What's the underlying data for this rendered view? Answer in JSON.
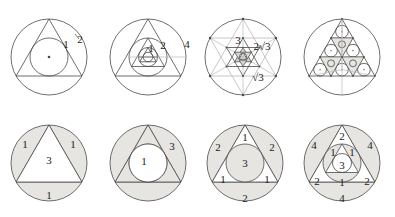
{
  "page": {
    "background_color": "#ffffff",
    "stroke_color": "#4a4a4a",
    "light_stroke_color": "#b9b9b9",
    "shade_color": "#e7e5e1",
    "text_color": "#1b1b1b",
    "rows": 2,
    "columns": 4
  },
  "figures": [
    {
      "id": "fig-top-1",
      "row": 1,
      "column": 1,
      "description": "Equilateral triangle with inscribed circle and circumscribed circle, center dot marked",
      "shaded": false,
      "labels": [
        {
          "text": "1",
          "role": "inradius",
          "x": 66,
          "y": 45
        },
        {
          "text": "2",
          "role": "circumradius",
          "x": 80,
          "y": 40
        }
      ]
    },
    {
      "id": "fig-top-2",
      "row": 1,
      "column": 2,
      "description": "Nested alternating triangles and circles showing doubling radii 1, 2, 4",
      "shaded": false,
      "labels": [
        {
          "text": "1",
          "role": "inner-radius",
          "x": 151,
          "y": 49
        },
        {
          "text": "2",
          "role": "middle-radius",
          "x": 163,
          "y": 46
        },
        {
          "text": "4",
          "role": "outer-radius",
          "x": 187,
          "y": 45
        }
      ]
    },
    {
      "id": "fig-top-3",
      "row": 1,
      "column": 3,
      "description": "Star-of-David lattice of triangles inside a circle with vertex dots, side lengths labelled",
      "shaded": false,
      "labels": [
        {
          "text": "3",
          "role": "side-upper",
          "x": 238,
          "y": 41
        },
        {
          "text": "2√3",
          "role": "side-diagonal",
          "x": 262,
          "y": 47
        },
        {
          "text": "√3",
          "role": "side-lower",
          "x": 258,
          "y": 78
        }
      ]
    },
    {
      "id": "fig-top-4",
      "row": 1,
      "column": 4,
      "description": "Triangle subdivided into nine sub-triangles, each with an inscribed circle, all inside a circle",
      "shaded": false,
      "labels": []
    },
    {
      "id": "fig-bottom-1",
      "row": 2,
      "column": 1,
      "description": "Triangle inscribed in circle; three circular segments shaded, each labelled 1, interior labelled 3",
      "shaded": true,
      "labels": [
        {
          "text": "1",
          "role": "segment-left",
          "x": 25,
          "y": 145
        },
        {
          "text": "1",
          "role": "segment-right",
          "x": 73,
          "y": 145
        },
        {
          "text": "3",
          "role": "triangle-interior",
          "x": 49,
          "y": 161
        },
        {
          "text": "1",
          "role": "segment-bottom",
          "x": 49,
          "y": 196
        }
      ]
    },
    {
      "id": "fig-bottom-2",
      "row": 2,
      "column": 2,
      "description": "Circle inscribed in triangle inscribed in circle; annular region shaded and labelled 3, inner disc labelled 1",
      "shaded": true,
      "labels": [
        {
          "text": "3",
          "role": "outer-region",
          "x": 172,
          "y": 147
        },
        {
          "text": "1",
          "role": "inner-disc",
          "x": 144,
          "y": 162
        }
      ]
    },
    {
      "id": "fig-bottom-3",
      "row": 2,
      "column": 3,
      "description": "Triangle between two circles; corner pieces labelled 1, circle segments labelled 2, inner disc labelled 3",
      "shaded": true,
      "labels": [
        {
          "text": "1",
          "role": "corner-top",
          "x": 245,
          "y": 138
        },
        {
          "text": "2",
          "role": "segment-left",
          "x": 218,
          "y": 148
        },
        {
          "text": "2",
          "role": "segment-right",
          "x": 272,
          "y": 148
        },
        {
          "text": "3",
          "role": "inner-disc",
          "x": 245,
          "y": 164
        },
        {
          "text": "1",
          "role": "corner-bottom-left",
          "x": 223,
          "y": 180
        },
        {
          "text": "1",
          "role": "corner-bottom-right",
          "x": 267,
          "y": 180
        },
        {
          "text": "2",
          "role": "segment-bottom",
          "x": 245,
          "y": 199
        }
      ]
    },
    {
      "id": "fig-bottom-4",
      "row": 2,
      "column": 4,
      "description": "Two nested triangles with two circles; regions labelled 4, 2, 1 and central region 3",
      "shaded": true,
      "labels": [
        {
          "text": "2",
          "role": "corner-top",
          "x": 342,
          "y": 137
        },
        {
          "text": "4",
          "role": "segment-left",
          "x": 314,
          "y": 146
        },
        {
          "text": "4",
          "role": "segment-right",
          "x": 370,
          "y": 146
        },
        {
          "text": "1",
          "role": "inner-top-left",
          "x": 333,
          "y": 153
        },
        {
          "text": "1",
          "role": "inner-top-right",
          "x": 352,
          "y": 153
        },
        {
          "text": "3",
          "role": "inner-center",
          "x": 342,
          "y": 166
        },
        {
          "text": "2",
          "role": "corner-bottom-left",
          "x": 317,
          "y": 182
        },
        {
          "text": "1",
          "role": "inner-bottom",
          "x": 342,
          "y": 183
        },
        {
          "text": "2",
          "role": "corner-bottom-right",
          "x": 367,
          "y": 182
        },
        {
          "text": "4",
          "role": "segment-bottom",
          "x": 342,
          "y": 199
        }
      ]
    }
  ]
}
